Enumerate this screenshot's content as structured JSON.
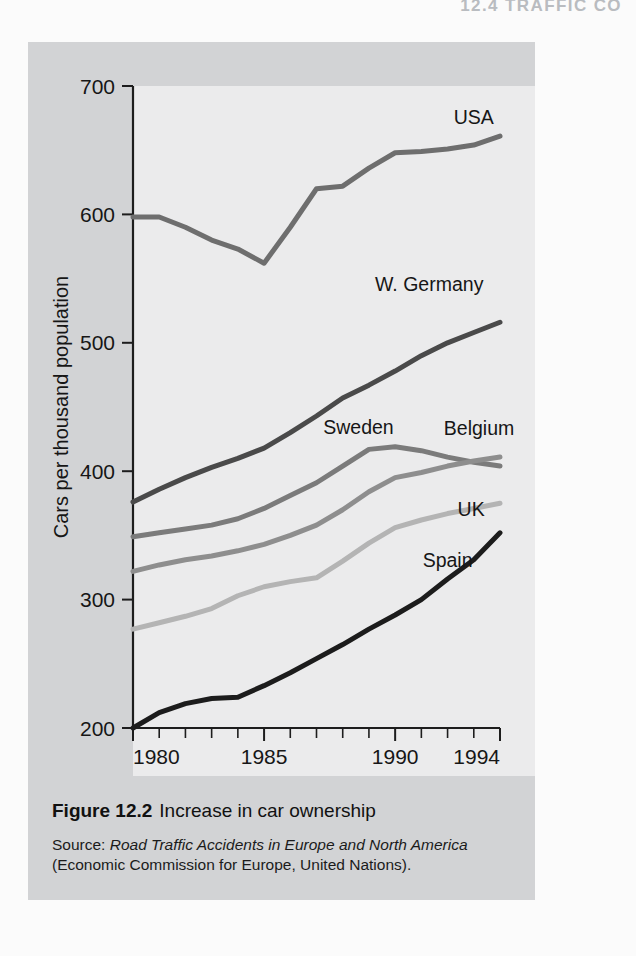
{
  "page": {
    "running_head": "12.4  TRAFFIC CO"
  },
  "caption": {
    "figure_number": "Figure 12.2",
    "title": "Increase in car ownership",
    "source_prefix": "Source:",
    "source_title": "Road Traffic Accidents in Europe and North America",
    "source_org": "(Economic Commission for Europe, United Nations)."
  },
  "chart_data": {
    "type": "line",
    "title": "Increase in car ownership",
    "xlabel": "",
    "ylabel": "Cars per thousand population",
    "xlim": [
      1980,
      1994
    ],
    "ylim": [
      200,
      700
    ],
    "yticks": [
      200,
      300,
      400,
      500,
      600,
      700
    ],
    "ytick_labels": [
      "200",
      "300",
      "400",
      "500",
      "600",
      "700"
    ],
    "xticks": [
      1980,
      1981,
      1982,
      1983,
      1984,
      1985,
      1986,
      1987,
      1988,
      1989,
      1990,
      1991,
      1992,
      1993,
      1994
    ],
    "xtick_labels_shown": [
      "1980",
      "1985",
      "1990",
      "1994"
    ],
    "xtick_labels_positions": [
      1980,
      1985,
      1990,
      1994
    ],
    "grid": false,
    "legend": "inline-labels-right",
    "x": [
      1980,
      1981,
      1982,
      1983,
      1984,
      1985,
      1986,
      1987,
      1988,
      1989,
      1990,
      1991,
      1992,
      1993,
      1994
    ],
    "series": [
      {
        "name": "USA",
        "color": "#6e6e6e",
        "width": 5.0,
        "label_x": 1993.0,
        "label_y": 675,
        "label_anchor": "middle",
        "values": [
          598,
          598,
          590,
          580,
          573,
          562,
          590,
          620,
          622,
          636,
          648,
          649,
          651,
          654,
          661
        ]
      },
      {
        "name": "W. Germany",
        "color": "#4a4a4a",
        "width": 5.0,
        "label_x": 1991.3,
        "label_y": 545,
        "label_anchor": "middle",
        "values": [
          376,
          386,
          395,
          403,
          410,
          418,
          430,
          443,
          457,
          467,
          478,
          490,
          500,
          508,
          516
        ]
      },
      {
        "name": "Sweden",
        "color": "#7b7b7b",
        "width": 5.0,
        "label_x": 1988.6,
        "label_y": 434,
        "label_anchor": "middle",
        "values": [
          349,
          352,
          355,
          358,
          363,
          371,
          381,
          391,
          404,
          417,
          419,
          416,
          411,
          407,
          404
        ]
      },
      {
        "name": "Belgium",
        "color": "#8e8e8e",
        "width": 5.0,
        "label_x": 1993.2,
        "label_y": 433,
        "label_anchor": "middle",
        "values": [
          322,
          327,
          331,
          334,
          338,
          343,
          350,
          358,
          370,
          384,
          395,
          399,
          404,
          408,
          411
        ]
      },
      {
        "name": "UK",
        "color": "#b4b4b4",
        "width": 5.0,
        "label_x": 1992.9,
        "label_y": 370,
        "label_anchor": "middle",
        "values": [
          277,
          282,
          287,
          293,
          303,
          310,
          314,
          317,
          330,
          344,
          356,
          362,
          367,
          371,
          375
        ]
      },
      {
        "name": "Spain",
        "color": "#1c1c1c",
        "width": 5.0,
        "label_x": 1992.0,
        "label_y": 330,
        "label_anchor": "middle",
        "values": [
          200,
          212,
          219,
          223,
          224,
          233,
          243,
          254,
          265,
          277,
          288,
          300,
          316,
          331,
          352
        ]
      }
    ]
  }
}
